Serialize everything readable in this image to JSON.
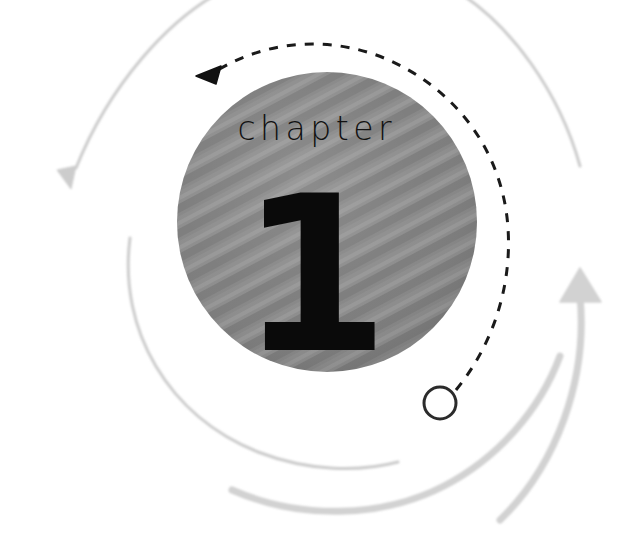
{
  "page": {
    "width": 629,
    "height": 539,
    "background_color": "#ffffff"
  },
  "chapter_badge": {
    "label": "chapter",
    "number": "1",
    "circle": {
      "center_x": 327,
      "center_y": 222,
      "radius": 150,
      "fill_color": "#8a8a8a",
      "texture": "diagonal-stripes"
    },
    "label_color": "#111111",
    "number_color": "#0a0a0a"
  },
  "decor": {
    "dashed_arc": {
      "name": "dashed-arrow-arc",
      "color": "#1a1a1a",
      "stroke_width": 3,
      "dash": "9 9",
      "direction": "counter-clockwise",
      "arrowhead_position": "top-left"
    },
    "start_marker": {
      "name": "open-circle-marker",
      "center_x": 440,
      "center_y": 403,
      "radius": 16,
      "stroke_color": "#2b2b2b",
      "fill_color": "#ffffff",
      "stroke_width": 3
    },
    "gray_arcs": [
      {
        "name": "thin-arc-top-left",
        "color": "#cfcfcf",
        "stroke_width": 3,
        "has_arrowhead": true,
        "arrowhead_position": "bottom-left"
      },
      {
        "name": "thin-arc-bottom-left",
        "color": "#cfcfcf",
        "stroke_width": 3,
        "has_arrowhead": false
      },
      {
        "name": "thick-arc-right",
        "color": "#d2d2d2",
        "stroke_width": 7,
        "has_arrowhead": true,
        "arrowhead_position": "top-right"
      },
      {
        "name": "thick-arc-bottom",
        "color": "#d2d2d2",
        "stroke_width": 7,
        "has_arrowhead": false
      }
    ]
  }
}
